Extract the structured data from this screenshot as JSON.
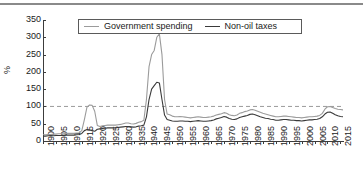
{
  "chart_data": {
    "type": "line",
    "title": "",
    "xlabel": "",
    "ylabel": "%",
    "ylim": [
      0,
      350
    ],
    "xlim": [
      1900,
      2016
    ],
    "yticks": [
      0,
      50,
      100,
      150,
      200,
      250,
      300,
      350
    ],
    "xticks": [
      1900,
      1905,
      1910,
      1915,
      1920,
      1925,
      1930,
      1935,
      1940,
      1945,
      1950,
      1955,
      1960,
      1965,
      1970,
      1975,
      1980,
      1985,
      1990,
      1995,
      2000,
      2005,
      2010,
      2015
    ],
    "grid": false,
    "legend_position": "top-center",
    "reference_line": {
      "y": 100,
      "style": "dashed",
      "color": "#9a9a9a"
    },
    "colors": {
      "government_spending": "#9b9b9b",
      "non_oil_taxes": "#3a3a3a"
    },
    "series": [
      {
        "name": "Government spending",
        "color": "#9b9b9b",
        "x": [
          1900,
          1901,
          1902,
          1903,
          1904,
          1905,
          1906,
          1907,
          1908,
          1909,
          1910,
          1911,
          1912,
          1913,
          1914,
          1915,
          1916,
          1917,
          1918,
          1919,
          1920,
          1921,
          1922,
          1923,
          1924,
          1925,
          1926,
          1927,
          1928,
          1929,
          1930,
          1931,
          1932,
          1933,
          1934,
          1935,
          1936,
          1937,
          1938,
          1939,
          1940,
          1941,
          1942,
          1943,
          1944,
          1945,
          1946,
          1947,
          1948,
          1949,
          1950,
          1951,
          1952,
          1953,
          1954,
          1955,
          1956,
          1957,
          1958,
          1959,
          1960,
          1961,
          1962,
          1963,
          1964,
          1965,
          1966,
          1967,
          1968,
          1969,
          1970,
          1971,
          1972,
          1973,
          1974,
          1975,
          1976,
          1977,
          1978,
          1979,
          1980,
          1981,
          1982,
          1983,
          1984,
          1985,
          1986,
          1987,
          1988,
          1989,
          1990,
          1991,
          1992,
          1993,
          1994,
          1995,
          1996,
          1997,
          1998,
          1999,
          2000,
          2001,
          2002,
          2003,
          2004,
          2005,
          2006,
          2007,
          2008,
          2009,
          2010,
          2011,
          2012,
          2013,
          2014,
          2015,
          2016
        ],
        "values": [
          18,
          18,
          19,
          19,
          20,
          20,
          21,
          21,
          21,
          22,
          22,
          22,
          22,
          23,
          24,
          30,
          62,
          98,
          104,
          103,
          86,
          45,
          42,
          44,
          45,
          46,
          46,
          46,
          46,
          47,
          48,
          50,
          52,
          52,
          50,
          49,
          51,
          54,
          56,
          60,
          120,
          215,
          250,
          262,
          300,
          310,
          250,
          120,
          78,
          76,
          72,
          70,
          70,
          71,
          70,
          69,
          68,
          67,
          68,
          69,
          70,
          69,
          68,
          68,
          69,
          70,
          72,
          75,
          77,
          79,
          82,
          80,
          76,
          74,
          73,
          75,
          80,
          82,
          85,
          87,
          90,
          91,
          89,
          86,
          83,
          80,
          78,
          76,
          74,
          72,
          70,
          70,
          71,
          72,
          72,
          71,
          70,
          69,
          68,
          68,
          67,
          68,
          69,
          70,
          70,
          71,
          72,
          74,
          80,
          92,
          99,
          100,
          97,
          94,
          92,
          91,
          90
        ]
      },
      {
        "name": "Non-oil taxes",
        "color": "#3a3a3a",
        "x": [
          1900,
          1901,
          1902,
          1903,
          1904,
          1905,
          1906,
          1907,
          1908,
          1909,
          1910,
          1911,
          1912,
          1913,
          1914,
          1915,
          1916,
          1917,
          1918,
          1919,
          1920,
          1921,
          1922,
          1923,
          1924,
          1925,
          1926,
          1927,
          1928,
          1929,
          1930,
          1931,
          1932,
          1933,
          1934,
          1935,
          1936,
          1937,
          1938,
          1939,
          1940,
          1941,
          1942,
          1943,
          1944,
          1945,
          1946,
          1947,
          1948,
          1949,
          1950,
          1951,
          1952,
          1953,
          1954,
          1955,
          1956,
          1957,
          1958,
          1959,
          1960,
          1961,
          1962,
          1963,
          1964,
          1965,
          1966,
          1967,
          1968,
          1969,
          1970,
          1971,
          1972,
          1973,
          1974,
          1975,
          1976,
          1977,
          1978,
          1979,
          1980,
          1981,
          1982,
          1983,
          1984,
          1985,
          1986,
          1987,
          1988,
          1989,
          1990,
          1991,
          1992,
          1993,
          1994,
          1995,
          1996,
          1997,
          1998,
          1999,
          2000,
          2001,
          2002,
          2003,
          2004,
          2005,
          2006,
          2007,
          2008,
          2009,
          2010,
          2011,
          2012,
          2013,
          2014,
          2015,
          2016
        ],
        "values": [
          14,
          14,
          15,
          15,
          15,
          16,
          16,
          16,
          16,
          17,
          17,
          17,
          17,
          18,
          19,
          22,
          30,
          33,
          32,
          30,
          28,
          34,
          35,
          36,
          37,
          38,
          38,
          38,
          38,
          39,
          40,
          41,
          42,
          42,
          41,
          40,
          41,
          43,
          44,
          46,
          70,
          120,
          150,
          160,
          170,
          168,
          120,
          75,
          62,
          60,
          58,
          57,
          57,
          58,
          58,
          57,
          57,
          56,
          57,
          58,
          59,
          58,
          57,
          57,
          58,
          59,
          61,
          64,
          66,
          68,
          71,
          69,
          65,
          63,
          62,
          64,
          68,
          70,
          72,
          74,
          77,
          78,
          76,
          73,
          70,
          68,
          66,
          65,
          63,
          62,
          60,
          60,
          61,
          62,
          62,
          61,
          60,
          60,
          59,
          59,
          58,
          59,
          60,
          61,
          61,
          62,
          63,
          65,
          70,
          78,
          83,
          84,
          80,
          76,
          73,
          71,
          70
        ]
      }
    ]
  },
  "legend": {
    "entries": [
      {
        "label": "Government spending",
        "color": "#9b9b9b"
      },
      {
        "label": "Non-oil taxes",
        "color": "#3a3a3a"
      }
    ]
  }
}
